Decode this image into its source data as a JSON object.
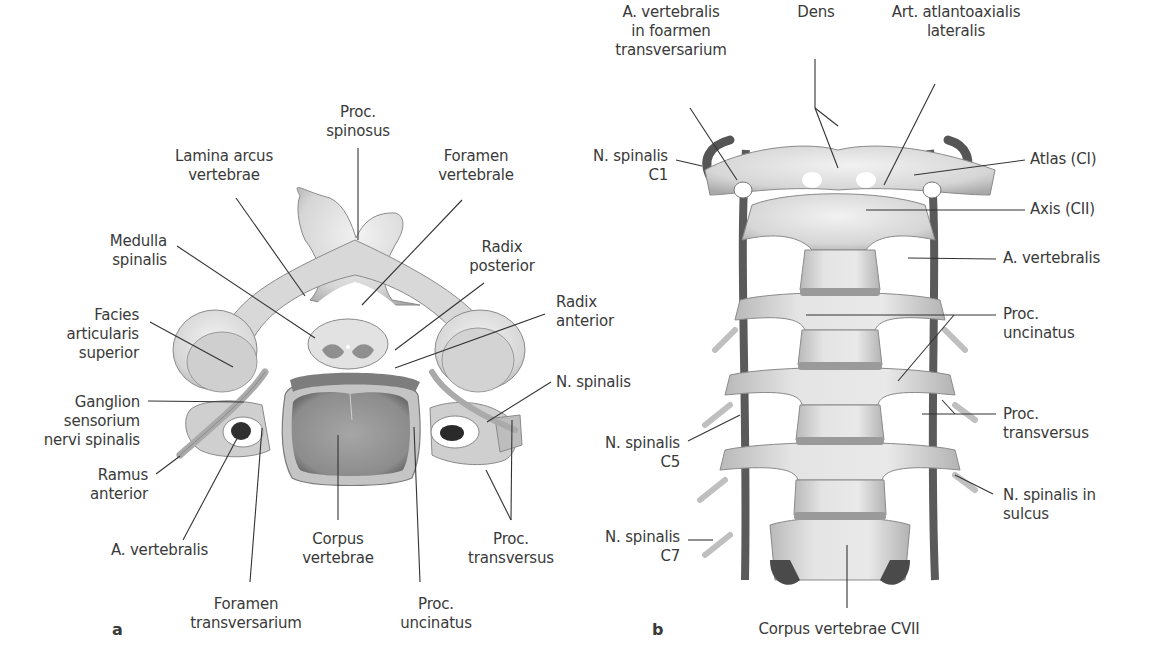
{
  "figure": {
    "panels": [
      {
        "id": "a",
        "letter": "a",
        "view": "superior view of cervical vertebra with spinal cord",
        "labels": [
          {
            "key": "proc_spinosus",
            "lines": [
              "Proc.",
              "spinosus"
            ],
            "x": 358,
            "y": 103,
            "align": "c"
          },
          {
            "key": "lamina_arcus_vertebrae",
            "lines": [
              "Lamina arcus",
              "vertebrae"
            ],
            "x": 224,
            "y": 147,
            "align": "c"
          },
          {
            "key": "foramen_vertebrale",
            "lines": [
              "Foramen",
              "vertebrale"
            ],
            "x": 476,
            "y": 147,
            "align": "c"
          },
          {
            "key": "medulla_spinalis",
            "lines": [
              "Medulla",
              "spinalis"
            ],
            "x": 167,
            "y": 232,
            "align": "r"
          },
          {
            "key": "radix_posterior",
            "lines": [
              "Radix",
              "posterior"
            ],
            "x": 502,
            "y": 238,
            "align": "c"
          },
          {
            "key": "radix_anterior",
            "lines": [
              "Radix",
              "anterior"
            ],
            "x": 556,
            "y": 293,
            "align": "l"
          },
          {
            "key": "facies_articularis_superior",
            "lines": [
              "Facies",
              "articularis",
              "superior"
            ],
            "x": 139,
            "y": 306,
            "align": "r"
          },
          {
            "key": "n_spinalis_a",
            "lines": [
              "N. spinalis"
            ],
            "x": 556,
            "y": 373,
            "align": "l"
          },
          {
            "key": "ganglion_sensorium",
            "lines": [
              "Ganglion",
              "sensorium",
              "nervi spinalis"
            ],
            "x": 140,
            "y": 393,
            "align": "r"
          },
          {
            "key": "ramus_anterior",
            "lines": [
              "Ramus",
              "anterior"
            ],
            "x": 148,
            "y": 466,
            "align": "r"
          },
          {
            "key": "a_vertebralis_a",
            "lines": [
              "A. vertebralis"
            ],
            "x": 111,
            "y": 541,
            "align": "l"
          },
          {
            "key": "corpus_vertebrae",
            "lines": [
              "Corpus",
              "vertebrae"
            ],
            "x": 338,
            "y": 530,
            "align": "c"
          },
          {
            "key": "proc_transversus_a",
            "lines": [
              "Proc.",
              "transversus"
            ],
            "x": 511,
            "y": 530,
            "align": "c"
          },
          {
            "key": "foramen_transversarium",
            "lines": [
              "Foramen",
              "transversarium"
            ],
            "x": 246,
            "y": 595,
            "align": "c"
          },
          {
            "key": "proc_uncinatus_a",
            "lines": [
              "Proc.",
              "uncinatus"
            ],
            "x": 436,
            "y": 595,
            "align": "c"
          }
        ]
      },
      {
        "id": "b",
        "letter": "b",
        "view": "anterior view of cervical spine",
        "labels": [
          {
            "key": "a_vertebralis_foramen",
            "lines": [
              "A. vertebralis",
              "in foarmen",
              "transversarium"
            ],
            "x": 671,
            "y": 33,
            "align": "c"
          },
          {
            "key": "dens",
            "lines": [
              "Dens"
            ],
            "x": 816,
            "y": 33,
            "align": "c"
          },
          {
            "key": "art_atlantoaxialis",
            "lines": [
              "Art. atlantoaxialis",
              "lateralis"
            ],
            "x": 956,
            "y": 33,
            "align": "c"
          },
          {
            "key": "n_spinalis_c1",
            "lines": [
              "N. spinalis",
              "C1"
            ],
            "x": 668,
            "y": 147,
            "align": "r"
          },
          {
            "key": "atlas",
            "lines": [
              "Atlas (CI)"
            ],
            "x": 1030,
            "y": 150,
            "align": "l"
          },
          {
            "key": "axis",
            "lines": [
              "Axis (CII)"
            ],
            "x": 1030,
            "y": 200,
            "align": "l"
          },
          {
            "key": "a_vertebralis_b",
            "lines": [
              "A. vertebralis"
            ],
            "x": 1003,
            "y": 249,
            "align": "l"
          },
          {
            "key": "proc_uncinatus_b",
            "lines": [
              "Proc.",
              "uncinatus"
            ],
            "x": 1003,
            "y": 305,
            "align": "l"
          },
          {
            "key": "n_spinalis_c5",
            "lines": [
              "N. spinalis",
              "C5"
            ],
            "x": 680,
            "y": 434,
            "align": "r"
          },
          {
            "key": "proc_transversus_b",
            "lines": [
              "Proc.",
              "transversus"
            ],
            "x": 1003,
            "y": 405,
            "align": "l"
          },
          {
            "key": "n_spinalis_sulcus",
            "lines": [
              "N. spinalis in",
              "sulcus"
            ],
            "x": 1003,
            "y": 486,
            "align": "l"
          },
          {
            "key": "n_spinalis_c7",
            "lines": [
              "N. spinalis",
              "C7"
            ],
            "x": 680,
            "y": 528,
            "align": "r"
          },
          {
            "key": "corpus_vertebrae_cvii",
            "lines": [
              "Corpus vertebrae CVII"
            ],
            "x": 839,
            "y": 620,
            "align": "c"
          }
        ]
      }
    ],
    "colors": {
      "background": "#ffffff",
      "text": "#3a3a3a",
      "leader": "#333333",
      "bone_light": "#e6e6e6",
      "bone_mid": "#bdbdbd",
      "bone_dark": "#7a7a7a",
      "vessel": "#5a5a5a"
    }
  }
}
